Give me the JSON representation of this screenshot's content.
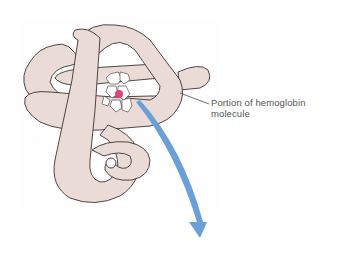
{
  "figure": {
    "callout": {
      "line1": "Portion of hemoglobin",
      "line2": "molecule"
    },
    "colors": {
      "protein_fill": "#ecdcd8",
      "protein_outline": "#3a3230",
      "iron_dot": "#e0457a",
      "arrow": "#6a9fd8",
      "text": "#555555"
    }
  }
}
